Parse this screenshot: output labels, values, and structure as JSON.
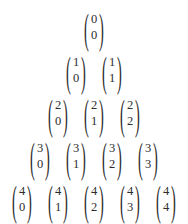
{
  "document": {
    "title": "Pascal's triangle of binomial coefficients",
    "ink_color": "#2c2c2c",
    "background_color": "#ffffff",
    "paren_left": "(",
    "paren_right": ")"
  },
  "chart_data": {
    "type": "table",
    "xlabel": "",
    "ylabel": "",
    "notation": "binomial coefficient n choose k",
    "rows": [
      {
        "n": "0",
        "cells": [
          {
            "n": "0",
            "k": "0"
          }
        ]
      },
      {
        "n": "1",
        "cells": [
          {
            "n": "1",
            "k": "0"
          },
          {
            "n": "1",
            "k": "1"
          }
        ]
      },
      {
        "n": "2",
        "cells": [
          {
            "n": "2",
            "k": "0"
          },
          {
            "n": "2",
            "k": "1"
          },
          {
            "n": "2",
            "k": "2"
          }
        ]
      },
      {
        "n": "3",
        "cells": [
          {
            "n": "3",
            "k": "0"
          },
          {
            "n": "3",
            "k": "1"
          },
          {
            "n": "3",
            "k": "2"
          },
          {
            "n": "3",
            "k": "3"
          }
        ]
      },
      {
        "n": "4",
        "cells": [
          {
            "n": "4",
            "k": "0"
          },
          {
            "n": "4",
            "k": "1"
          },
          {
            "n": "4",
            "k": "2"
          },
          {
            "n": "4",
            "k": "3"
          },
          {
            "n": "4",
            "k": "4"
          }
        ]
      }
    ]
  }
}
